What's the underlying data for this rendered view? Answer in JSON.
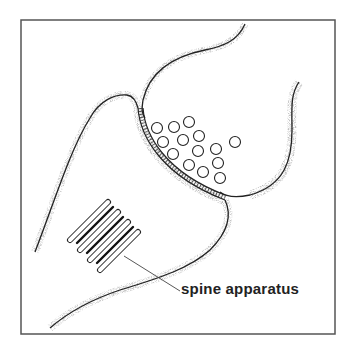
{
  "figure": {
    "type": "synapse illustration",
    "labels": {
      "spine_apparatus": "spine apparatus"
    },
    "colors": {
      "stroke": "#222222",
      "frame": "#555555",
      "background": "#ffffff",
      "stipple": "#444444"
    },
    "vesicles": [
      {
        "cx": 157,
        "cy": 128
      },
      {
        "cx": 174,
        "cy": 127
      },
      {
        "cx": 189,
        "cy": 122
      },
      {
        "cx": 163,
        "cy": 142
      },
      {
        "cx": 183,
        "cy": 140
      },
      {
        "cx": 199,
        "cy": 136
      },
      {
        "cx": 173,
        "cy": 154
      },
      {
        "cx": 198,
        "cy": 151
      },
      {
        "cx": 216,
        "cy": 149
      },
      {
        "cx": 235,
        "cy": 142
      },
      {
        "cx": 189,
        "cy": 165
      },
      {
        "cx": 203,
        "cy": 172
      },
      {
        "cx": 218,
        "cy": 163
      },
      {
        "cx": 220,
        "cy": 178
      }
    ]
  }
}
